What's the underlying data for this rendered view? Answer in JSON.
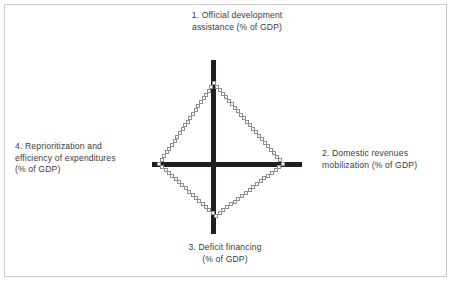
{
  "figure": {
    "background_color": "#ffffff",
    "frame_color": "#c9c9c9",
    "axis_color": "#231f20",
    "marker_outline_color": "#8e8e8e",
    "text_color": "#3b3b3b"
  },
  "labels": {
    "top": "1. Official development\nassistance (% of GDP)",
    "right": "2. Domestic revenues\nmobilization (% of GDP)",
    "bottom": "3. Deficit financing\n(% of GDP)",
    "left": "4. Reprioritization  and\nefficiency of expenditures\n(% of GDP)"
  },
  "chart_data": {
    "type": "line",
    "title": "",
    "subtitle": "",
    "xlabel": "",
    "ylabel": "",
    "grid": false,
    "legend": "none",
    "axes_style": "cross",
    "marker": "open-square",
    "categories": [
      "1. Official development assistance (% of GDP)",
      "2. Domestic revenues mobilization (% of GDP)",
      "3. Deficit financing (% of GDP)",
      "4. Reprioritization and efficiency of expenditures (% of GDP)"
    ],
    "axis_directions": [
      "up",
      "right",
      "down",
      "left"
    ],
    "series": [
      {
        "name": "Fiscal space diamond",
        "values": [
          0.81,
          0.82,
          0.6,
          0.7
        ]
      }
    ],
    "vertices_px": {
      "top": [
        214,
        83
      ],
      "right": [
        283,
        164
      ],
      "bottom": [
        216,
        216
      ],
      "left": [
        159,
        164
      ],
      "center": [
        213,
        164
      ]
    },
    "axis_extent_px": {
      "vertical": [
        60,
        233
      ],
      "horizontal": [
        152,
        302
      ]
    }
  }
}
